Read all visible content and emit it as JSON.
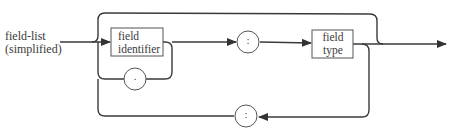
{
  "diagram": {
    "title_line1": "field-list",
    "title_line2": "(simplified)",
    "nodes": {
      "field_identifier": {
        "line1": "field",
        "line2": "identifier"
      },
      "colon_separator": {
        "symbol": ":"
      },
      "field_type": {
        "line1": "field",
        "line2": "type"
      },
      "dot_separator": {
        "symbol": "."
      },
      "return_colon": {
        "symbol": ":"
      }
    },
    "colors": {
      "stroke": "#3a3a3a",
      "background": "#ffffff"
    }
  }
}
